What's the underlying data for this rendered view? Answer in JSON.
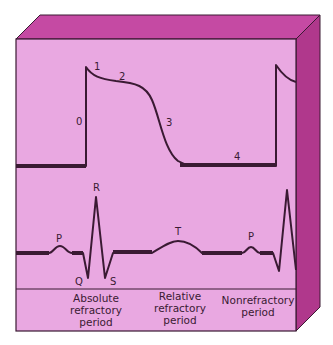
{
  "colors": {
    "front": "#e9a8e1",
    "top": "#c54aa3",
    "side": "#b0388c",
    "stroke": "#3a1a33"
  },
  "action_potential": {
    "phase_labels": [
      "0",
      "1",
      "2",
      "3",
      "4"
    ]
  },
  "ecg": {
    "wave_labels": {
      "p1": "P",
      "q": "Q",
      "r": "R",
      "s": "S",
      "t": "T",
      "p2": "P"
    }
  },
  "periods": [
    {
      "lines": [
        "Absolute",
        "refractory",
        "period"
      ]
    },
    {
      "lines": [
        "Relative",
        "refractory",
        "period"
      ]
    },
    {
      "lines": [
        "Nonrefractory",
        "period"
      ]
    }
  ]
}
